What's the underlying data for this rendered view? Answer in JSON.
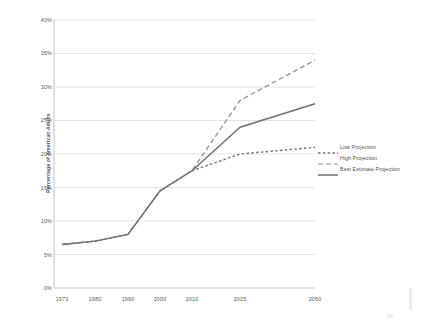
{
  "chart_data": {
    "type": "line",
    "title": "",
    "xlabel": "",
    "ylabel": "Percentage of American Adults",
    "categories": [
      "1973",
      "1980",
      "1990",
      "2000",
      "2010",
      "2025",
      "2050"
    ],
    "x_positions": [
      62,
      95,
      128,
      160,
      192,
      240,
      315
    ],
    "ylim": [
      0,
      40
    ],
    "y_ticks": [
      "0%",
      "5%",
      "10%",
      "15%",
      "20%",
      "25%",
      "30%",
      "35%",
      "40%"
    ],
    "y_tick_values": [
      0,
      5,
      10,
      15,
      20,
      25,
      30,
      35,
      40
    ],
    "grid": true,
    "legend_position": "right",
    "series": [
      {
        "name": "Low Projection",
        "style": "dotted",
        "color": "#7a7a7a",
        "x": [
          "1973",
          "1980",
          "1990",
          "2000",
          "2010",
          "2025",
          "2050"
        ],
        "values": [
          6.5,
          7.0,
          8.0,
          14.5,
          17.5,
          20.0,
          21.0
        ]
      },
      {
        "name": "High Projection",
        "style": "dashed",
        "color": "#8d8d8d",
        "x": [
          "1973",
          "1980",
          "1990",
          "2000",
          "2010",
          "2025",
          "2050"
        ],
        "values": [
          6.5,
          7.0,
          8.0,
          14.5,
          17.5,
          28.0,
          34.0
        ]
      },
      {
        "name": "Best Estimate Projection",
        "style": "solid",
        "color": "#6e6e6e",
        "x": [
          "1973",
          "1980",
          "1990",
          "2000",
          "2010",
          "2025",
          "2050"
        ],
        "values": [
          6.5,
          7.0,
          8.0,
          14.5,
          17.5,
          24.0,
          27.5
        ]
      }
    ]
  },
  "axes": {
    "y_title": "Percentage of American Adults",
    "y_labels": [
      "40%",
      "35%",
      "30%",
      "25%",
      "20%",
      "15%",
      "10%",
      "5%",
      "0%"
    ],
    "x_labels": [
      "1973",
      "1980",
      "1990",
      "2000",
      "2010",
      "2025",
      "2050"
    ]
  },
  "legend": {
    "items": [
      {
        "label": "Low Projection",
        "style": "dotted"
      },
      {
        "label": "High Projection",
        "style": "dashed"
      },
      {
        "label": "Best Estimate Projection",
        "style": "solid"
      }
    ]
  },
  "colors": {
    "grid": "#d9d9d9",
    "axis": "#b0b0b0",
    "line_low": "#7a7a7a",
    "line_high": "#8d8d8d",
    "line_best": "#6e6e6e",
    "text": "#595959",
    "background": "#ffffff"
  }
}
